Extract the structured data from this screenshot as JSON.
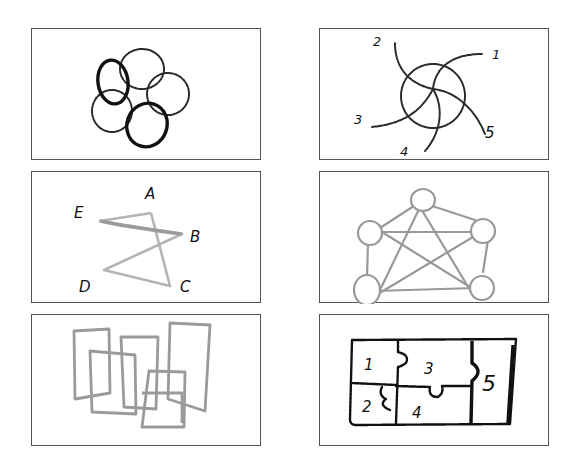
{
  "colors": {
    "border": "#555555",
    "ink_black": "#111111",
    "ink_dark": "#2a2a2a",
    "ink_gray": "#9a9a9a",
    "ink_light_gray": "#b4b4b4"
  },
  "panels": [
    {
      "id": "interlocking-rings",
      "position": "row1-left",
      "description": "Five overlapping circles arranged in a ring; two drawn with heavy black outline, three with lighter sketchy outline",
      "labels": []
    },
    {
      "id": "spiral-arms",
      "position": "row1-right",
      "description": "Circle with five curved arms radiating out in a pinwheel, each arm numbered",
      "labels": [
        "1",
        "2",
        "3",
        "4",
        "5"
      ]
    },
    {
      "id": "pentagram-letters",
      "position": "row2-left",
      "description": "Five-pointed star drawn in gray with vertices labeled by letters",
      "labels": [
        "A",
        "B",
        "C",
        "D",
        "E"
      ]
    },
    {
      "id": "complete-graph",
      "position": "row2-right",
      "description": "Five nodes as circles, fully connected by edges forming pentagon plus inner star",
      "labels": []
    },
    {
      "id": "overlapping-rectangles",
      "position": "row3-left",
      "description": "Several tall gray rectangles overlapping one another",
      "labels": []
    },
    {
      "id": "puzzle-regions",
      "position": "row3-right",
      "description": "Rectangle partitioned into five jigsaw-like numbered regions",
      "labels": [
        "1",
        "2",
        "3",
        "4",
        "5"
      ]
    }
  ]
}
